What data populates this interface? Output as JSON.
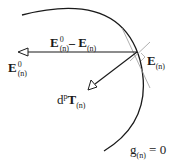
{
  "diagram": {
    "labels": {
      "difference_vector": {
        "base": "E",
        "sup": "0",
        "sub": "(n)",
        "minus": "–",
        "base2": "E",
        "sub2": "(n)"
      },
      "trial_point": {
        "base": "E",
        "sub": "(n)"
      },
      "elastic_predictor": {
        "base": "E",
        "sup": "0",
        "sub": "(n)"
      },
      "plastic_increment": {
        "prefix": "d",
        "sup": "p",
        "base": "T",
        "sub": "(n)"
      },
      "yield_surface": {
        "base": "g",
        "sub": "(n)",
        "rhs": "= 0"
      }
    },
    "colors": {
      "stroke": "#1a1a1a",
      "tangent": "#9a9a9a"
    }
  }
}
